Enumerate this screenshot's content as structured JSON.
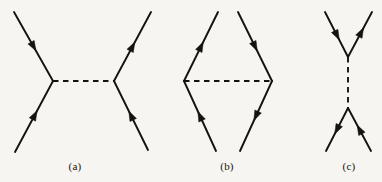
{
  "figure": {
    "kind": "feynman-diagram-figure",
    "background_color": "#f6f5f1",
    "stroke_color": "#15130f",
    "width": 382,
    "height": 182,
    "panels": [
      {
        "id": "a",
        "label": "(a)",
        "label_x": 75,
        "label_y": 167,
        "topology": "s-channel",
        "propagator": {
          "style": "dashed",
          "orientation": "horizontal",
          "x1": 53,
          "y1": 81,
          "x2": 114,
          "y2": 81
        },
        "vertices": [
          {
            "name": "left-vertex",
            "x": 53,
            "y": 81
          },
          {
            "name": "right-vertex",
            "x": 114,
            "y": 81
          }
        ],
        "fermion_lines": [
          {
            "name": "upper-left-leg",
            "x1": 14,
            "y1": 12,
            "x2": 53,
            "y2": 81,
            "arrow_at": 0.5,
            "arrow_direction": "down-right"
          },
          {
            "name": "lower-left-leg",
            "x1": 15,
            "y1": 152,
            "x2": 53,
            "y2": 81,
            "arrow_at": 0.52,
            "arrow_direction": "up-right"
          },
          {
            "name": "upper-right-leg",
            "x1": 114,
            "y1": 81,
            "x2": 151,
            "y2": 12,
            "arrow_at": 0.5,
            "arrow_direction": "up-right"
          },
          {
            "name": "lower-right-leg",
            "x1": 148,
            "y1": 150,
            "x2": 114,
            "y2": 81,
            "arrow_at": 0.5,
            "arrow_direction": "up-left"
          }
        ]
      },
      {
        "id": "b",
        "label": "(b)",
        "label_x": 227,
        "label_y": 167,
        "topology": "rhombus",
        "propagator": {
          "style": "dashed",
          "orientation": "horizontal",
          "x1": 184,
          "y1": 81,
          "x2": 272,
          "y2": 81
        },
        "vertices": [
          {
            "name": "left-vertex",
            "x": 184,
            "y": 81
          },
          {
            "name": "right-vertex",
            "x": 272,
            "y": 81
          }
        ],
        "fermion_lines": [
          {
            "name": "upper-left-leg",
            "x1": 184,
            "y1": 81,
            "x2": 218,
            "y2": 12,
            "arrow_at": 0.5,
            "arrow_direction": "up-right"
          },
          {
            "name": "upper-right-leg",
            "x1": 238,
            "y1": 12,
            "x2": 272,
            "y2": 81,
            "arrow_at": 0.5,
            "arrow_direction": "down-right"
          },
          {
            "name": "lower-left-leg",
            "x1": 216,
            "y1": 151,
            "x2": 184,
            "y2": 81,
            "arrow_at": 0.5,
            "arrow_direction": "up-left"
          },
          {
            "name": "lower-right-leg",
            "x1": 272,
            "y1": 81,
            "x2": 240,
            "y2": 151,
            "arrow_at": 0.5,
            "arrow_direction": "down-left"
          }
        ]
      },
      {
        "id": "c",
        "label": "(c)",
        "label_x": 349,
        "label_y": 167,
        "topology": "t-channel",
        "propagator": {
          "style": "dashed",
          "orientation": "vertical",
          "x1": 348,
          "y1": 57,
          "x2": 348,
          "y2": 108
        },
        "vertices": [
          {
            "name": "top-vertex",
            "x": 348,
            "y": 57
          },
          {
            "name": "bottom-vertex",
            "x": 348,
            "y": 108
          }
        ],
        "fermion_lines": [
          {
            "name": "upper-left-leg",
            "x1": 325,
            "y1": 12,
            "x2": 348,
            "y2": 57,
            "arrow_at": 0.52,
            "arrow_direction": "down-right"
          },
          {
            "name": "upper-right-leg",
            "x1": 348,
            "y1": 57,
            "x2": 372,
            "y2": 12,
            "arrow_at": 0.55,
            "arrow_direction": "up-right"
          },
          {
            "name": "lower-left-leg",
            "x1": 348,
            "y1": 108,
            "x2": 326,
            "y2": 151,
            "arrow_at": 0.5,
            "arrow_direction": "down-left"
          },
          {
            "name": "lower-right-leg",
            "x1": 371,
            "y1": 151,
            "x2": 348,
            "y2": 108,
            "arrow_at": 0.5,
            "arrow_direction": "up-left"
          }
        ]
      }
    ]
  }
}
